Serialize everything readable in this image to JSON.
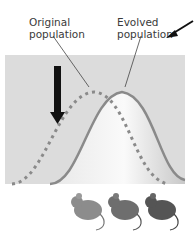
{
  "labels": {
    "original": [
      "Original",
      "population"
    ],
    "evolved": [
      "Evolved",
      "population"
    ]
  },
  "colors": {
    "panel_bg": "#dcdcdc",
    "evolved_curve": "#8a8a8a",
    "original_curve": "#8a8a8a",
    "arrow": "#111111",
    "mouse_light": "#8c8c8c",
    "mouse_mid": "#6e6e6e",
    "mouse_dark": "#555555"
  },
  "mice_count": 3
}
